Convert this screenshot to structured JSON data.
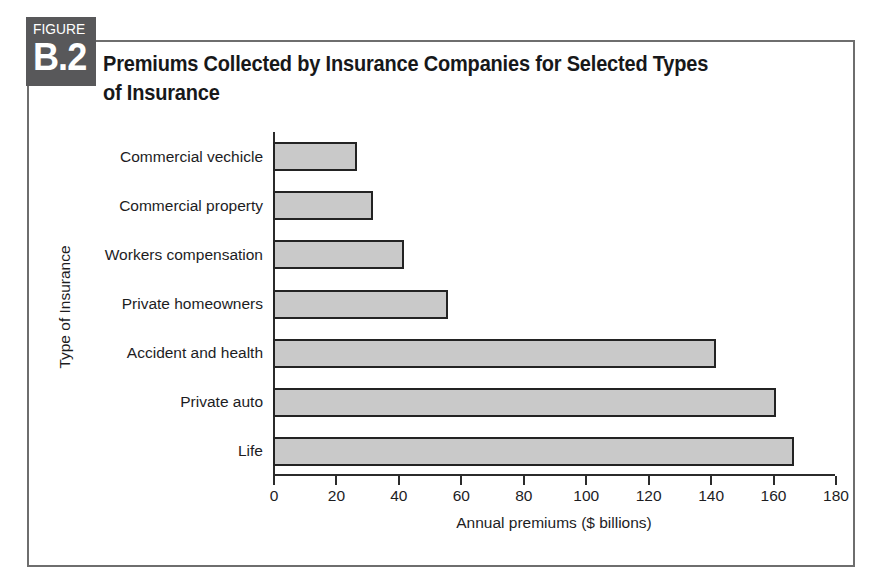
{
  "figure": {
    "badge_kicker": "FIGURE",
    "badge_number": "B.2",
    "title": "Premiums Collected by Insurance Companies for Selected Types of Insurance"
  },
  "chart_data": {
    "type": "bar",
    "orientation": "horizontal",
    "title": "Premiums Collected by Insurance Companies for Selected Types of Insurance",
    "xlabel": "Annual premiums ($ billions)",
    "ylabel": "Type of Insurance",
    "xlim": [
      0,
      180
    ],
    "xticks": [
      0,
      20,
      40,
      60,
      80,
      100,
      120,
      140,
      160,
      180
    ],
    "xtick_labels": [
      "0",
      "20",
      "40",
      "60",
      "80",
      "100",
      "120",
      "140",
      "160",
      "180"
    ],
    "grid": false,
    "legend": "none",
    "bar_fill_color": "#c9c9c9",
    "bar_edge_color": "#232323",
    "categories": [
      "Commercial vechicle",
      "Commercial property",
      "Workers compensation",
      "Private homeowners",
      "Accident and health",
      "Private auto",
      "Life"
    ],
    "values": [
      27,
      32,
      42,
      56,
      142,
      161,
      167
    ],
    "units": "$ billions"
  }
}
